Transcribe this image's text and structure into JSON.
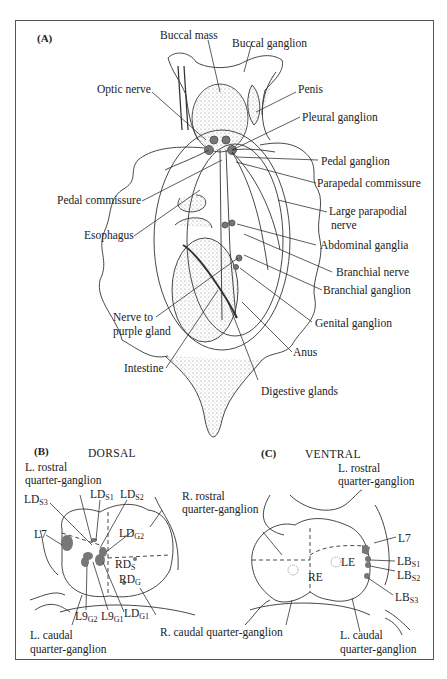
{
  "figure": {
    "panelA": {
      "label": "(A)",
      "labels": {
        "buccal_mass": "Buccal mass",
        "buccal_ganglion": "Buccal ganglion",
        "optic_nerve": "Optic nerve",
        "penis": "Penis",
        "pleural_ganglion": "Pleural ganglion",
        "pedal_ganglion": "Pedal ganglion",
        "parapedal_commissure": "Parapedal commissure",
        "pedal_commissure": "Pedal commissure",
        "large_parapodial_nerve_1": "Large parapodial",
        "large_parapodial_nerve_2": "nerve",
        "esophagus": "Esophagus",
        "abdominal_ganglia": "Abdominal ganglia",
        "branchial_nerve": "Branchial nerve",
        "branchial_ganglion": "Branchial ganglion",
        "nerve_to_purple_gland_1": "Nerve to",
        "nerve_to_purple_gland_2": "purple gland",
        "genital_ganglion": "Genital ganglion",
        "anus": "Anus",
        "intestine": "Intestine",
        "digestive_glands": "Digestive glands"
      }
    },
    "panelB": {
      "label": "(B)",
      "title": "DORSAL",
      "labels": {
        "l_rostral_1": "L. rostral",
        "l_rostral_2": "quarter-ganglion",
        "ld_s3": "LD",
        "ld_s3_sub": "S3",
        "ld_s1": "LD",
        "ld_s1_sub": "S1",
        "ld_s2": "LD",
        "ld_s2_sub": "S2",
        "r_rostral_1": "R. rostral",
        "r_rostral_2": "quarter-ganglion",
        "l7": "L7",
        "ld_g2": "LD",
        "ld_g2_sub": "G2",
        "rd_s": "RD",
        "rd_s_sub": "S",
        "rd_g": "RD",
        "rd_g_sub": "G",
        "l9_g2": "L9",
        "l9_g2_sub": "G2",
        "l9_g1": "L9",
        "l9_g1_sub": "G1",
        "ld_g1": "LD",
        "ld_g1_sub": "G1",
        "l_caudal_1": "L. caudal",
        "l_caudal_2": "quarter-ganglion",
        "r_caudal": "R. caudal quarter-ganglion"
      }
    },
    "panelC": {
      "label": "(C)",
      "title": "VENTRAL",
      "labels": {
        "l_rostral_1": "L. rostral",
        "l_rostral_2": "quarter-ganglion",
        "r_rostral_fragment": "quarter-ganglion",
        "l7": "L7",
        "lb_s1": "LB",
        "lb_s1_sub": "S1",
        "lb_s2": "LB",
        "lb_s2_sub": "S2",
        "lb_s3": "LB",
        "lb_s3_sub": "S3",
        "le": "LE",
        "re": "RE",
        "l_caudal_1": "L. caudal",
        "l_caudal_2": "quarter-ganglion"
      }
    },
    "colors": {
      "ink": "#222222",
      "neuron_fill": "#777777",
      "frame": "#555555"
    }
  }
}
